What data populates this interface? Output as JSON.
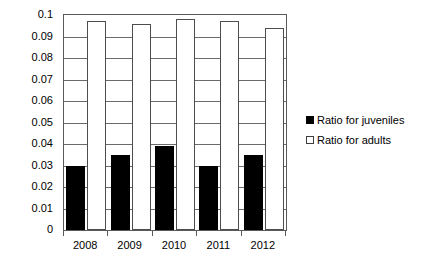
{
  "chart_data": {
    "type": "bar",
    "title": "",
    "subtitle": "",
    "xlabel": "",
    "ylabel": "",
    "categories": [
      "2008",
      "2009",
      "2010",
      "2011",
      "2012"
    ],
    "series": [
      {
        "name": "Ratio for juveniles",
        "marker": "filled-square",
        "color": "#000000",
        "values": [
          0.03,
          0.035,
          0.039,
          0.03,
          0.035
        ]
      },
      {
        "name": "Ratio for adults",
        "marker": "hollow-square",
        "color": "#ffffff",
        "values": [
          0.097,
          0.096,
          0.098,
          0.097,
          0.094
        ]
      }
    ],
    "ylim": [
      0,
      0.1
    ],
    "ytick_values": [
      0,
      0.01,
      0.02,
      0.03,
      0.04,
      0.05,
      0.06,
      0.07,
      0.08,
      0.09,
      0.1
    ],
    "ytick_labels": [
      "0",
      "0.01",
      "0.02",
      "0.03",
      "0.04",
      "0.05",
      "0.06",
      "0.07",
      "0.08",
      "0.09",
      "0.1"
    ],
    "grid": true,
    "grid_axis": "y",
    "legend_position": "right"
  },
  "legend": {
    "entries": [
      {
        "label": "Ratio for juveniles"
      },
      {
        "label": "Ratio for adults"
      }
    ]
  },
  "axes": {
    "x_labels": [
      "2008",
      "2009",
      "2010",
      "2011",
      "2012"
    ],
    "y_labels": [
      "0.1",
      "0.09",
      "0.08",
      "0.07",
      "0.06",
      "0.05",
      "0.04",
      "0.03",
      "0.02",
      "0.01",
      "0"
    ]
  }
}
